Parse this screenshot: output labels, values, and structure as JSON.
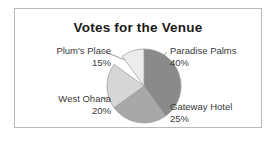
{
  "card": {
    "title": "Votes for the Venue",
    "border_color": "#b9b9b9",
    "background": "#ffffff"
  },
  "chart_data": {
    "type": "pie",
    "title": "Votes for the Venue",
    "xlabel": "",
    "ylabel": "",
    "legend_position": "none",
    "labels_position": "outside-with-leader-lines",
    "start_angle_deg": 0,
    "direction": "clockwise",
    "units": "percent",
    "categories": [
      "Paradise Palms",
      "Gateway Hotel",
      "West Ohana",
      "Plum's Place"
    ],
    "values": [
      40,
      25,
      20,
      15
    ],
    "colors": [
      "#8a8a8a",
      "#a8a8a8",
      "#d6d6d6",
      "#ececec"
    ],
    "slices": [
      {
        "name": "Paradise Palms",
        "value": 40,
        "value_text": "40%",
        "color": "#8a8a8a",
        "start_deg": 0,
        "end_deg": 144
      },
      {
        "name": "Gateway Hotel",
        "value": 25,
        "value_text": "25%",
        "color": "#a8a8a8",
        "start_deg": 144,
        "end_deg": 234
      },
      {
        "name": "West Ohana",
        "value": 20,
        "value_text": "20%",
        "color": "#d6d6d6",
        "start_deg": 234,
        "end_deg": 306
      },
      {
        "name": "Plum's Place",
        "value": 15,
        "value_text": "15%",
        "color": "#ececec",
        "start_deg": 306,
        "end_deg": 360
      }
    ],
    "total": 100,
    "total_text": "100%"
  },
  "labels": {
    "plums": {
      "name": "Plum's Place",
      "pct": "15%"
    },
    "west": {
      "name": "West Ohana",
      "pct": "20%"
    },
    "paradise": {
      "name": "Paradise Palms",
      "pct": "40%"
    },
    "gateway": {
      "name": "Gateway Hotel",
      "pct": "25%"
    }
  },
  "style": {
    "slice_outline": "#9a9a9a",
    "leader_line": "#8d8d8d",
    "text_color": "#3a3a3a",
    "title_color": "#1b1b1b"
  }
}
